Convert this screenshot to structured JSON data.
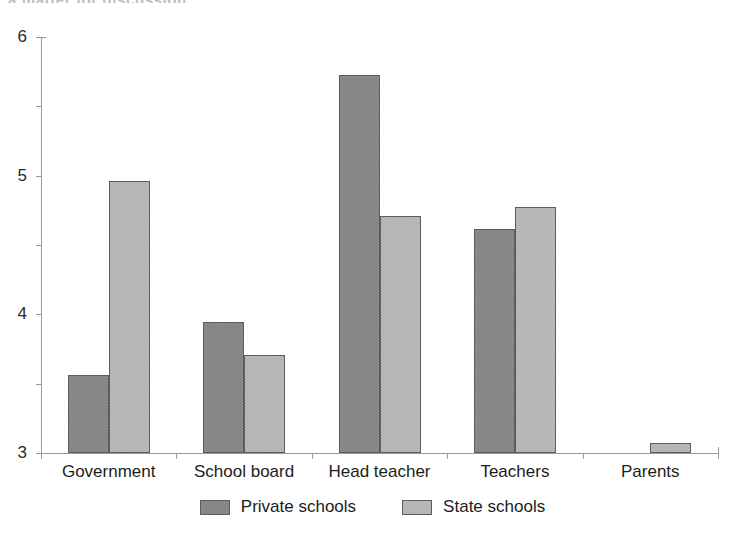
{
  "figure": {
    "cut_off_title_fragment": "a matter for discussion"
  },
  "chart_data": {
    "type": "bar",
    "title": "",
    "xlabel": "",
    "ylabel": "",
    "ylim": [
      0,
      6
    ],
    "yticks": [
      "0",
      "1",
      "2",
      "3",
      "4",
      "5",
      "6"
    ],
    "grid": false,
    "legend_position": "bottom-center",
    "categories": [
      "Government",
      "School board",
      "Head teacher",
      "Teachers",
      "Parents"
    ],
    "series": [
      {
        "name": "Private schools",
        "color": "#8e8e8e",
        "values": [
          1.13,
          1.89,
          5.45,
          3.23,
          0
        ]
      },
      {
        "name": "State schools",
        "color": "#bdbdbd",
        "values": [
          3.92,
          1.42,
          3.42,
          3.55,
          0.15
        ]
      }
    ]
  }
}
